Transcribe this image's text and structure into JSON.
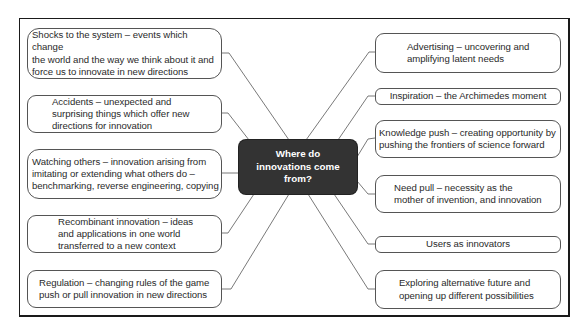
{
  "diagram": {
    "type": "mind-map",
    "center": {
      "label": "Where do\ninnovations come\nfrom?",
      "fill": "#333333",
      "text_color": "#ffffff"
    },
    "left_nodes": [
      {
        "id": "shocks",
        "label": "Shocks to the system – events which change\nthe world and the way we think about it and\nforce us to innovate in new directions"
      },
      {
        "id": "accidents",
        "label": "Accidents – unexpected and\nsurprising things which offer new\ndirections for innovation"
      },
      {
        "id": "watching",
        "label": "Watching others – innovation arising from\nimitating or extending what others do –\nbenchmarking, reverse engineering, copying"
      },
      {
        "id": "recombinant",
        "label": "Recombinant innovation – ideas\nand applications in one world\ntransferred to a new context"
      },
      {
        "id": "regulation",
        "label": "Regulation – changing rules of the game\npush or pull innovation in new directions"
      }
    ],
    "right_nodes": [
      {
        "id": "advertising",
        "label": "Advertising – uncovering and\namplifying latent needs"
      },
      {
        "id": "inspiration",
        "label": "Inspiration – the Archimedes moment"
      },
      {
        "id": "knowledge",
        "label": "Knowledge push – creating opportunity by\npushing the frontiers of science forward"
      },
      {
        "id": "need",
        "label": "Need pull – necessity as the\nmother of invention, and innovation"
      },
      {
        "id": "users",
        "label": "Users as innovators"
      },
      {
        "id": "exploring",
        "label": "Exploring alternative future and\nopening up different possibilities"
      }
    ],
    "line_color": "#666666",
    "border_color": "#1a1a1a"
  }
}
